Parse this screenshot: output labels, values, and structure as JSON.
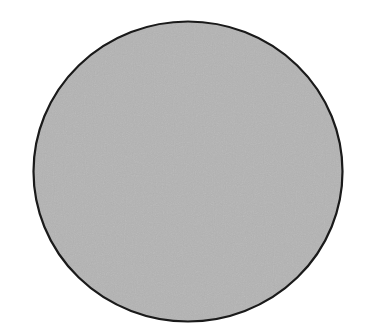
{
  "figure": {
    "shape": "ellipse",
    "fill_color": "#b4b4b4",
    "stroke_color": "#1a1a1a",
    "background_color": "#ffffff"
  }
}
